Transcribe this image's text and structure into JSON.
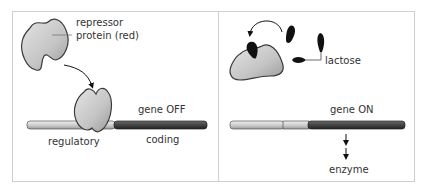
{
  "panels": {
    "left": {
      "repressor_label_line1": "repressor",
      "repressor_label_line2": "protein (red)",
      "gene_state": "gene OFF",
      "regulatory_label": "regulatory",
      "coding_label": "coding"
    },
    "right": {
      "inducer_label": "lactose",
      "gene_state": "gene ON",
      "product_label": "enzyme"
    }
  },
  "colors": {
    "protein_fill": "#c8c8c8",
    "protein_outline": "#3a3a3a",
    "regulatory_dna": "#d4d4d4",
    "coding_dna": "#4a4a4a",
    "lactose": "#111111",
    "frame": "#cfcfcf"
  }
}
